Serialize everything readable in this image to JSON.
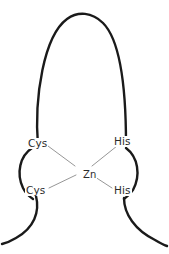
{
  "diagram": {
    "type": "zinc-finger-coordination",
    "background_color": "#ffffff",
    "backbone_color": "#1a1a1a",
    "bond_color": "#8a8a8a",
    "label_color": "#2b2b2b",
    "metal": {
      "label": "Zn",
      "x": 82,
      "y": 170
    },
    "residues": [
      {
        "id": "cys-upper-left",
        "label": "Cys",
        "x": 27,
        "y": 138,
        "side": "left",
        "position": "upper"
      },
      {
        "id": "his-upper-right",
        "label": "His",
        "x": 113,
        "y": 136,
        "side": "right",
        "position": "upper"
      },
      {
        "id": "cys-lower-left",
        "label": "Cys",
        "x": 25,
        "y": 185,
        "side": "left",
        "position": "lower"
      },
      {
        "id": "his-lower-right",
        "label": "His",
        "x": 113,
        "y": 185,
        "side": "right",
        "position": "lower"
      }
    ],
    "strokes": {
      "top_arch": "M 38 147 C 34 96 44 36 67 19 C 78 11 92 12 103 23 C 122 42 126 96 126 144",
      "left_bracket": "M 32 148 C 20 156 16 173 23 188 C 26 194 30 197 33 199",
      "right_bracket": "M 126 148 C 138 157 141 175 133 190 C 130 195 127 197 124 199",
      "left_tail": "M 36 196 C 40 212 34 228 16 238 C 11 241 6 243 2 244",
      "right_tail": "M 124 198 C 124 214 135 230 155 240 C 160 243 164 245 167 246"
    },
    "bonds": [
      {
        "id": "bond-cys-upper",
        "from": "cys-upper-left",
        "to": "metal",
        "x1": 48,
        "y1": 146,
        "x2": 75,
        "y2": 166
      },
      {
        "id": "bond-his-upper",
        "from": "his-upper-right",
        "to": "metal",
        "x1": 117,
        "y1": 146,
        "x2": 92,
        "y2": 166
      },
      {
        "id": "bond-cys-lower",
        "from": "cys-lower-left",
        "to": "metal",
        "x1": 49,
        "y1": 188,
        "x2": 76,
        "y2": 175
      },
      {
        "id": "bond-his-lower",
        "from": "his-lower-right",
        "to": "metal",
        "x1": 112,
        "y1": 188,
        "x2": 92,
        "y2": 175
      }
    ],
    "stroke_widths": {
      "arch": 2.4,
      "bracket": 2.4,
      "tail": 2.4
    }
  }
}
